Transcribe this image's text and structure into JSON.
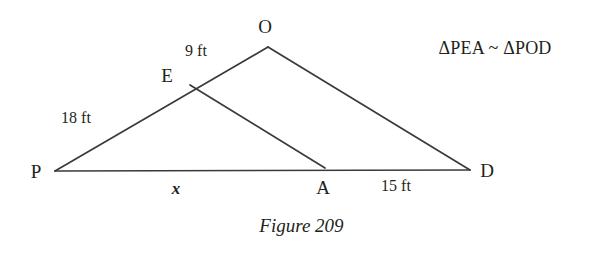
{
  "figure": {
    "caption": "Figure 209",
    "similarity_statement": "ΔPEA ~ ΔPOD",
    "background_color": "#ffffff",
    "line_color": "#3a3a3a",
    "text_color": "#231f20"
  },
  "vertices": [
    {
      "name": "P",
      "label": "P",
      "x": 55,
      "y": 171,
      "label_x": 36,
      "label_y": 171
    },
    {
      "name": "O",
      "label": "O",
      "x": 268,
      "y": 47,
      "label_x": 265,
      "label_y": 26
    },
    {
      "name": "D",
      "label": "D",
      "x": 470,
      "y": 170,
      "label_x": 487,
      "label_y": 170
    },
    {
      "name": "E",
      "label": "E",
      "x": 190,
      "y": 85,
      "label_x": 167,
      "label_y": 75
    },
    {
      "name": "A",
      "label": "A",
      "x": 325,
      "y": 168,
      "label_x": 323,
      "label_y": 187
    }
  ],
  "segments": [
    {
      "name": "P-to-O",
      "from": "P",
      "to": "O"
    },
    {
      "name": "O-to-D",
      "from": "O",
      "to": "D"
    },
    {
      "name": "P-to-D",
      "from": "P",
      "to": "D"
    },
    {
      "name": "E-to-A",
      "from": "E",
      "to": "A"
    }
  ],
  "measurements": [
    {
      "name": "segment-EO-length",
      "text": "9 ft",
      "x": 196,
      "y": 51,
      "style": "plain"
    },
    {
      "name": "segment-PE-length",
      "text": "18 ft",
      "x": 76,
      "y": 118,
      "style": "plain"
    },
    {
      "name": "segment-PA-length",
      "text": "x",
      "x": 176,
      "y": 188,
      "style": "unknown"
    },
    {
      "name": "segment-AD-length",
      "text": "15 ft",
      "x": 396,
      "y": 186,
      "style": "plain"
    }
  ],
  "annotations": {
    "similarity": {
      "text": "ΔPEA ~ ΔPOD",
      "x": 495,
      "y": 48
    }
  },
  "chart_data": {
    "type": "diagram",
    "title": "Figure 209",
    "points": {
      "P": [
        55,
        171
      ],
      "O": [
        268,
        47
      ],
      "D": [
        470,
        170
      ],
      "E": [
        190,
        85
      ],
      "A": [
        325,
        168
      ]
    },
    "edges": [
      [
        "P",
        "O"
      ],
      [
        "O",
        "D"
      ],
      [
        "P",
        "D"
      ],
      [
        "E",
        "A"
      ]
    ],
    "labeled_lengths": {
      "PE": "18 ft",
      "EO": "9 ft",
      "PA": "x",
      "AD": "15 ft"
    },
    "relation": "ΔPEA ~ ΔPOD"
  }
}
